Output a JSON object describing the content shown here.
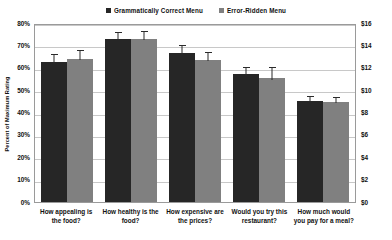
{
  "chart_data": {
    "type": "bar",
    "title": "",
    "subtitle": "",
    "categories": [
      "How appealing is the food?",
      "How healthy is the food?",
      "How expensive are the prices?",
      "Would you try this restaurant?",
      "How much would you pay for a meal?"
    ],
    "series": [
      {
        "name": "Grammatically Correct Menu",
        "color": "#262626",
        "values": [
          62.5,
          73.0,
          66.5,
          57.0,
          45.0
        ],
        "errors": [
          3.5,
          3.0,
          3.5,
          3.5,
          2.5
        ]
      },
      {
        "name": "Error-Ridden Menu",
        "color": "#808080",
        "values": [
          64.0,
          73.0,
          63.5,
          55.5,
          44.5
        ],
        "errors": [
          4.0,
          3.5,
          3.5,
          5.0,
          2.5
        ]
      }
    ],
    "xlabel": "",
    "ylabel": "Percent of Maximum Rating",
    "ylim": [
      0,
      80
    ],
    "yticks": [
      "0%",
      "10%",
      "20%",
      "30%",
      "40%",
      "50%",
      "60%",
      "70%",
      "80%"
    ],
    "y2label": "",
    "y2lim": [
      0,
      16
    ],
    "y2ticks": [
      "$0",
      "$2",
      "$4",
      "$6",
      "$8",
      "$10",
      "$12",
      "$14",
      "$16"
    ],
    "grid": true,
    "legend_position": "top-center",
    "error_bars": true
  },
  "legend": {
    "entries": [
      {
        "label": "Grammatically Correct Menu",
        "color": "#262626"
      },
      {
        "label": "Error-Ridden Menu",
        "color": "#808080"
      }
    ]
  },
  "axes": {
    "left_title": "Percent of Maximum Rating"
  }
}
